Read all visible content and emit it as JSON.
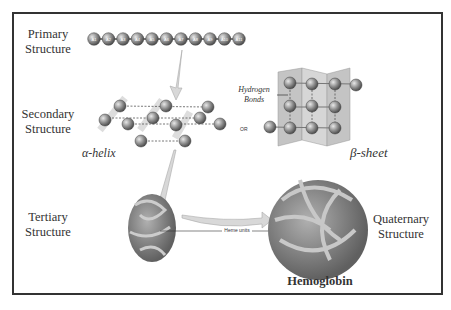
{
  "diagram": {
    "labels": {
      "primary": "Primary\nStructure",
      "primary_l1": "Primary",
      "primary_l2": "Structure",
      "secondary_l1": "Secondary",
      "secondary_l2": "Structure",
      "tertiary_l1": "Tertiary",
      "tertiary_l2": "Structure",
      "quaternary_l1": "Quaternary",
      "quaternary_l2": "Structure",
      "alpha_helix": "α-helix",
      "beta_sheet": "β-sheet",
      "hydrogen_l1": "Hydrogen",
      "hydrogen_l2": "Bonds",
      "or": "OR",
      "heme_units": "Heme units",
      "hemoglobin": "Hemoglobin"
    },
    "primary_chain_beads": [
      "A1",
      "A2",
      "A3",
      "A4",
      "A5",
      "A6",
      "A7",
      "A8",
      "A9",
      "A10",
      "A11"
    ],
    "colors": {
      "frame": "#333333",
      "bead": "#8a8a8a",
      "sheet": "#c8c8c8",
      "arrow": "#d8d8d8",
      "protein": "#888888"
    }
  }
}
